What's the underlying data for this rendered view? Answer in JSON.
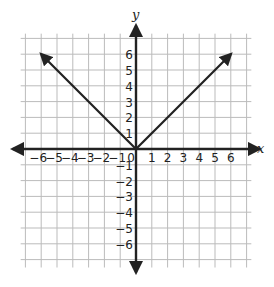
{
  "graph": {
    "title": "Graph of y = |x|",
    "x_axis_label": "x",
    "y_axis_label": "y",
    "x_ticks": [
      "−6",
      "−5",
      "−4",
      "−3",
      "−2",
      "−1",
      "0",
      "1",
      "2",
      "3",
      "4",
      "5",
      "6"
    ],
    "y_ticks_pos": [
      "1",
      "2",
      "3",
      "4",
      "5",
      "6"
    ],
    "y_ticks_neg": [
      "−1",
      "−2",
      "−3",
      "−4",
      "−5",
      "−6"
    ],
    "x_range": [
      -7,
      7
    ],
    "y_range": [
      -7,
      7
    ],
    "line_color": "#222222",
    "grid_color": "#bbbbbb"
  },
  "chart_data": {
    "type": "line",
    "title": "",
    "xlabel": "x",
    "ylabel": "y",
    "xlim": [
      -7,
      7
    ],
    "ylim": [
      -7,
      7
    ],
    "grid": true,
    "series": [
      {
        "name": "y = |x|",
        "x": [
          -6,
          0,
          6
        ],
        "y": [
          6,
          0,
          6
        ]
      }
    ]
  }
}
